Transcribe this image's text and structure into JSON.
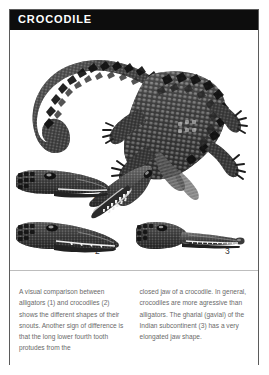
{
  "header": {
    "title": "CROCODILE"
  },
  "plate": {
    "name": "crocodile-comparison-plate",
    "figures": [
      {
        "id": "main-crocodile",
        "semantic": "crocodile-full-body-photo",
        "description": "Full-body crocodile viewed from above with tail curving to the left and jaws open at lower right"
      },
      {
        "id": "head-1",
        "semantic": "alligator-head-profile",
        "description": "Alligator head in side profile with broad rounded snout"
      },
      {
        "id": "head-2",
        "semantic": "crocodile-head-profile",
        "description": "Crocodile head in side profile with narrower pointed snout"
      },
      {
        "id": "head-3",
        "semantic": "gharial-head-profile",
        "description": "Gharial head in side profile with very long slender snout"
      }
    ],
    "callouts": [
      {
        "label": "1",
        "refers_to": "alligator-head-profile"
      },
      {
        "label": "2",
        "refers_to": "crocodile-head-profile"
      },
      {
        "label": "3",
        "refers_to": "gharial-head-profile"
      }
    ]
  },
  "caption": {
    "column_left": "A visual comparison between alligators (1) and crocodiles (2) shows the different shapes of their snouts. Another sign of difference is that the long lower fourth tooth protudes from the",
    "column_right": "closed jaw of a crocodile. In general, crocodiles are more agressive than alligators. The gharial (gavial) of the Indian subcontinent (3) has a very elongated jaw shape."
  },
  "colors": {
    "titlebar_bg": "#0d0d0d",
    "titlebar_text": "#ffffff",
    "frame_border": "#5b5b5b",
    "caption_text": "#6a6a6a",
    "callout_text": "#2c2c2c",
    "page_bg": "#ffffff"
  }
}
